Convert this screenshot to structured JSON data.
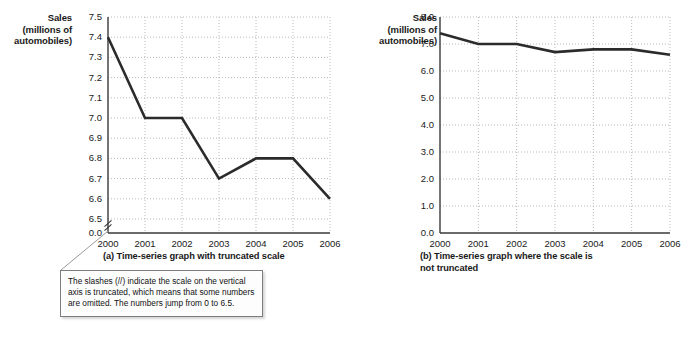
{
  "chart_data": [
    {
      "id": "a",
      "type": "line",
      "title": "(a) Time-series graph with truncated scale",
      "ylabel": "Sales (millions of automobiles)",
      "ylabel_lines": [
        "Sales",
        "(millions of",
        "automobiles)"
      ],
      "xlabel": "",
      "categories": [
        "2000",
        "2001",
        "2002",
        "2003",
        "2004",
        "2005",
        "2006"
      ],
      "values": [
        7.4,
        7.0,
        7.0,
        6.7,
        6.8,
        6.8,
        6.6
      ],
      "yticks": [
        "7.5",
        "7.4",
        "7.3",
        "7.2",
        "7.1",
        "7.0",
        "6.9",
        "6.8",
        "6.7",
        "6.6",
        "6.5",
        "0.0"
      ],
      "ytick_values": [
        7.5,
        7.4,
        7.3,
        7.2,
        7.1,
        7.0,
        6.9,
        6.8,
        6.7,
        6.6,
        6.5,
        0.0
      ],
      "ylim": [
        6.5,
        7.5
      ],
      "axis_truncated": true,
      "truncation_marker": "//",
      "grid": "dotted both axes",
      "legend": "none",
      "line_color": "#2b2b2b"
    },
    {
      "id": "b",
      "type": "line",
      "title": "(b) Time-series graph where the scale is not truncated",
      "title_lines": [
        "(b) Time-series graph where the scale is",
        "not truncated"
      ],
      "ylabel": "Sales (millions of automobiles)",
      "ylabel_lines": [
        "Sales",
        "(millions of",
        "automobiles)"
      ],
      "xlabel": "",
      "categories": [
        "2000",
        "2001",
        "2002",
        "2003",
        "2004",
        "2005",
        "2006"
      ],
      "values": [
        7.4,
        7.0,
        7.0,
        6.7,
        6.8,
        6.8,
        6.6
      ],
      "yticks": [
        "8.0",
        "7.0",
        "6.0",
        "5.0",
        "4.0",
        "3.0",
        "2.0",
        "1.0",
        "0.0"
      ],
      "ytick_values": [
        8.0,
        7.0,
        6.0,
        5.0,
        4.0,
        3.0,
        2.0,
        1.0,
        0.0
      ],
      "ylim": [
        0.0,
        8.0
      ],
      "axis_truncated": false,
      "grid": "dotted both axes",
      "legend": "none",
      "line_color": "#2b2b2b"
    }
  ],
  "figure_a": {
    "caption": "(a) Time-series graph with truncated scale",
    "axis_title_lines": [
      "Sales",
      "(millions of",
      "automobiles)"
    ]
  },
  "figure_b": {
    "caption_line1": "(b) Time-series graph where the scale is",
    "caption_line2": "not truncated",
    "axis_title_lines": [
      "Sales",
      "(millions of",
      "automobiles)"
    ]
  },
  "callout": {
    "text": "The slashes (//) indicate the scale on the vertical axis is truncated, which means that some numbers are omitted.  The numbers jump from 0 to 6.5."
  },
  "colors": {
    "line": "#2b2b2b",
    "axis": "#3a3a3a",
    "grid": "#a8a8a8",
    "callout_border": "#7d7d7d",
    "text": "#1a1a1a"
  }
}
